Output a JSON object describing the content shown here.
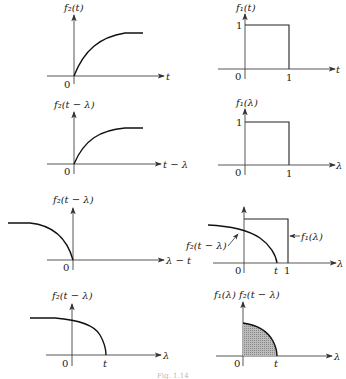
{
  "panels": {
    "p1": {
      "ylabel": "f₂(t)",
      "xlabel": "t",
      "origin": "0"
    },
    "p2": {
      "ylabel": "f₁(t)",
      "xlabel": "t",
      "origin": "0",
      "ytick": "1",
      "xtick": "1"
    },
    "p3": {
      "ylabel": "f₂(t − λ)",
      "xlabel": "t − λ",
      "origin": "0"
    },
    "p4": {
      "ylabel": "f₁(λ)",
      "xlabel": "λ",
      "origin": "0",
      "ytick": "1",
      "xtick": "1"
    },
    "p5": {
      "ylabel": "f₂(t − λ)",
      "xlabel": "λ − t",
      "origin": "0"
    },
    "p6": {
      "xlabel": "λ",
      "origin": "0",
      "xtick_t": "t",
      "xtick_1": "1",
      "label_f2": "f₂(t − λ)",
      "label_f1": "f₁(λ)"
    },
    "p7": {
      "ylabel": "f₂(t − λ)",
      "xlabel": "λ",
      "origin": "0",
      "xtick_t": "t"
    },
    "p8": {
      "ylabel": "f₁(λ) f₂(t − λ)",
      "xlabel": "λ",
      "origin": "0",
      "xtick_t": "t"
    }
  },
  "caption": "Fig. 1.14"
}
